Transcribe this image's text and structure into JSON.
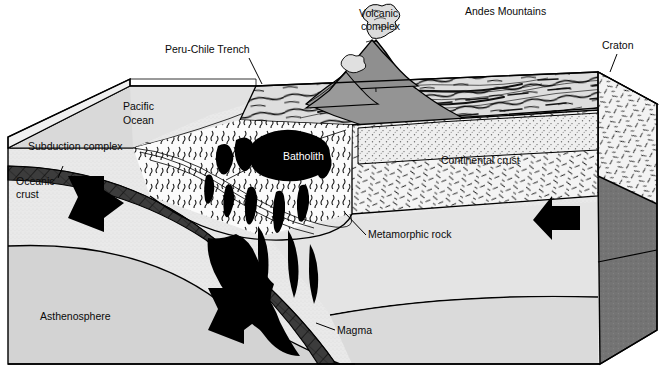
{
  "figure": {
    "kind": "geologic-block-diagram",
    "frame_border_color": "#000000",
    "background_color": "#ffffff"
  },
  "palette": {
    "ocean_top": "#d7d7d7",
    "land_top": "#dcdcdc",
    "asthenosphere": "#d2d2d2",
    "mantle_lithosphere": "#e6e6e6",
    "continental_crust": "#f2f2f2",
    "right_face_dark": "#6f6f6f",
    "right_face_mid": "#8a8a8a",
    "volcano_dark": "#8c8c8c",
    "slab_dark": "#3a3a3a",
    "magma_black": "#000000",
    "arrow_black": "#000000",
    "sediment_stipple": "#ededed",
    "outline": "#000000",
    "label_text": "#0a0a0a",
    "batholith_text": "#ffffff"
  },
  "labels": [
    {
      "id": "peru-chile-trench",
      "text": "Peru-Chile Trench",
      "x": 165,
      "y": 53,
      "anchor": "start",
      "leader": true,
      "leader_path": "M249,58 L262,84"
    },
    {
      "id": "volcanic-complex-1",
      "text": "Volcanic",
      "x": 359,
      "y": 17,
      "anchor": "start",
      "leader": false,
      "leader_path": ""
    },
    {
      "id": "volcanic-complex-2",
      "text": "complex",
      "x": 361,
      "y": 30,
      "anchor": "start",
      "leader": false,
      "leader_path": ""
    },
    {
      "id": "andes-mountains",
      "text": "Andes Mountains",
      "x": 465,
      "y": 15,
      "anchor": "start",
      "leader": false,
      "leader_path": ""
    },
    {
      "id": "craton",
      "text": "Craton",
      "x": 602,
      "y": 49,
      "anchor": "start",
      "leader": true,
      "leader_path": "M617,54 L610,72"
    },
    {
      "id": "pacific-ocean-1",
      "text": "Pacific",
      "x": 123,
      "y": 110,
      "anchor": "start",
      "leader": false,
      "leader_path": ""
    },
    {
      "id": "pacific-ocean-2",
      "text": "Ocean",
      "x": 123,
      "y": 124,
      "anchor": "start",
      "leader": false,
      "leader_path": ""
    },
    {
      "id": "subduction-complex",
      "text": "Subduction complex",
      "x": 28,
      "y": 150,
      "anchor": "start",
      "leader": false,
      "leader_path": ""
    },
    {
      "id": "oceanic-crust-1",
      "text": "Oceanic",
      "x": 16,
      "y": 185,
      "anchor": "start",
      "leader": true,
      "leader_path": "M58,178 L63,166"
    },
    {
      "id": "oceanic-crust-2",
      "text": "crust",
      "x": 16,
      "y": 198,
      "anchor": "start",
      "leader": false,
      "leader_path": ""
    },
    {
      "id": "batholith",
      "text": "Batholith",
      "x": 283,
      "y": 160,
      "anchor": "start",
      "leader": false,
      "leader_path": ""
    },
    {
      "id": "continental-crust",
      "text": "Continental crust",
      "x": 441,
      "y": 164,
      "anchor": "start",
      "leader": false,
      "leader_path": ""
    },
    {
      "id": "metamorphic-rock",
      "text": "Metamorphic rock",
      "x": 368,
      "y": 238,
      "anchor": "start",
      "leader": true,
      "leader_path": "M366,235 L345,213"
    },
    {
      "id": "magma",
      "text": "Magma",
      "x": 337,
      "y": 334,
      "anchor": "start",
      "leader": true,
      "leader_path": "M335,330 L318,324"
    },
    {
      "id": "asthenosphere",
      "text": "Asthenosphere",
      "x": 40,
      "y": 320,
      "anchor": "start",
      "leader": false,
      "leader_path": ""
    }
  ],
  "arrows": [
    {
      "id": "arrow-ocean-plate-convergence",
      "direction": "down-right",
      "x": 72,
      "y": 178,
      "scale": 1.0
    },
    {
      "id": "arrow-slab-descent",
      "direction": "down-right",
      "x": 213,
      "y": 292,
      "scale": 1.0
    },
    {
      "id": "arrow-continental-convergence",
      "direction": "left",
      "x": 533,
      "y": 205,
      "scale": 1.0
    }
  ],
  "features": [
    {
      "id": "oceanic-plate",
      "name": "Oceanic plate (subducting)"
    },
    {
      "id": "trench",
      "name": "Peru-Chile Trench"
    },
    {
      "id": "accretionary-wedge",
      "name": "Subduction complex / accretionary wedge"
    },
    {
      "id": "volcanic-arc",
      "name": "Volcanic complex and Andes Mountains"
    },
    {
      "id": "batholith-body",
      "name": "Batholith (black plutonic mass)"
    },
    {
      "id": "magma-plumes",
      "name": "Rising magma plumes"
    },
    {
      "id": "metamorphic-aureole",
      "name": "Metamorphic rock zone"
    },
    {
      "id": "continental-crust-body",
      "name": "Continental crust"
    },
    {
      "id": "craton-body",
      "name": "Craton"
    },
    {
      "id": "asthenosphere-body",
      "name": "Asthenosphere"
    }
  ]
}
